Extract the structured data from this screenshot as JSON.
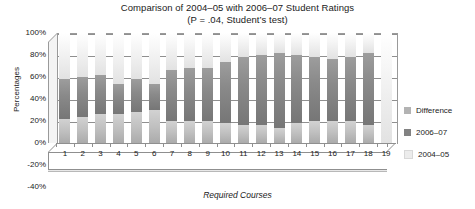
{
  "chart_data": {
    "type": "bar",
    "title": "Comparison of 2004–05 with 2006–07 Student Ratings",
    "subtitle": "(P = .04, Student’s test)",
    "xlabel": "Required Courses",
    "ylabel": "Percentages",
    "ylim": [
      -40,
      100
    ],
    "grid": true,
    "stacked": true,
    "legend_position": "right",
    "categories": [
      "1",
      "2",
      "3",
      "4",
      "5",
      "6",
      "7",
      "8",
      "9",
      "10",
      "11",
      "12",
      "13",
      "14",
      "15",
      "16",
      "17",
      "18",
      "19"
    ],
    "ytick_labels": [
      "100%",
      "80%",
      "60%",
      "40%",
      "20%",
      "0%",
      "-20%",
      "-40%"
    ],
    "ytick_values": [
      100,
      80,
      60,
      40,
      20,
      0,
      -20,
      -40
    ],
    "series": [
      {
        "name": "2004–05",
        "color": "#ececec",
        "values": [
          42,
          40,
          38,
          46,
          42,
          46,
          34,
          32,
          32,
          26,
          22,
          20,
          18,
          20,
          22,
          24,
          22,
          18,
          100
        ]
      },
      {
        "name": "2006–07",
        "color": "#828282",
        "values": [
          36,
          36,
          36,
          28,
          30,
          24,
          46,
          48,
          48,
          56,
          62,
          64,
          68,
          62,
          58,
          56,
          58,
          66,
          0
        ]
      },
      {
        "name": "Difference",
        "color": "#c4c4c4",
        "values": [
          22,
          24,
          26,
          26,
          28,
          30,
          20,
          20,
          20,
          18,
          16,
          16,
          14,
          18,
          20,
          20,
          20,
          16,
          0
        ]
      }
    ]
  },
  "legend": {
    "items": [
      {
        "label": "Difference",
        "color": "#b3b3b3"
      },
      {
        "label": "2006–07",
        "color": "#828282"
      },
      {
        "label": "2004–05",
        "color": "#ececec"
      }
    ]
  }
}
